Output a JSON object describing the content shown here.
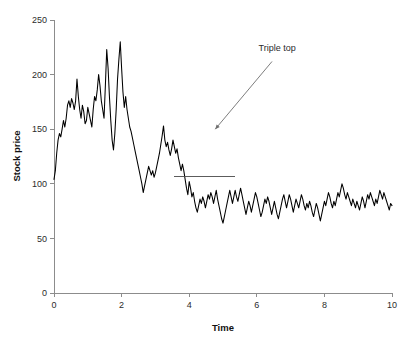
{
  "chart_data": {
    "type": "line",
    "title": "",
    "xlabel": "Time",
    "ylabel": "Stock price",
    "xlim": [
      0,
      10
    ],
    "ylim": [
      0,
      250
    ],
    "xticks": [
      0,
      2,
      4,
      6,
      8,
      10
    ],
    "xtick_labels": [
      "0",
      "2",
      "4",
      "6",
      "8",
      "10"
    ],
    "yticks": [
      0,
      50,
      100,
      150,
      200,
      250
    ],
    "ytick_labels": [
      "0",
      "50",
      "100",
      "150",
      "200",
      "250"
    ],
    "grid": false,
    "legend": false,
    "line_color": "#000000",
    "series": [
      {
        "name": "Stock price",
        "x": [
          0.0,
          0.04,
          0.08,
          0.12,
          0.16,
          0.2,
          0.24,
          0.28,
          0.32,
          0.36,
          0.4,
          0.44,
          0.48,
          0.52,
          0.56,
          0.6,
          0.64,
          0.68,
          0.72,
          0.76,
          0.8,
          0.84,
          0.88,
          0.92,
          0.96,
          1.0,
          1.04,
          1.08,
          1.12,
          1.16,
          1.2,
          1.24,
          1.28,
          1.32,
          1.36,
          1.4,
          1.44,
          1.48,
          1.52,
          1.56,
          1.6,
          1.64,
          1.68,
          1.72,
          1.76,
          1.8,
          1.84,
          1.88,
          1.92,
          1.96,
          2.0,
          2.04,
          2.08,
          2.12,
          2.16,
          2.2,
          2.24,
          2.28,
          2.32,
          2.36,
          2.4,
          2.44,
          2.48,
          2.52,
          2.56,
          2.6,
          2.64,
          2.68,
          2.72,
          2.76,
          2.8,
          2.84,
          2.88,
          2.92,
          2.96,
          3.0,
          3.04,
          3.08,
          3.12,
          3.16,
          3.2,
          3.24,
          3.28,
          3.32,
          3.36,
          3.4,
          3.44,
          3.48,
          3.52,
          3.56,
          3.6,
          3.64,
          3.68,
          3.72,
          3.76,
          3.8,
          3.84,
          3.88,
          3.92,
          3.96,
          4.0,
          4.04,
          4.08,
          4.12,
          4.16,
          4.2,
          4.24,
          4.28,
          4.32,
          4.36,
          4.4,
          4.44,
          4.48,
          4.52,
          4.56,
          4.6,
          4.64,
          4.68,
          4.72,
          4.76,
          4.8,
          4.84,
          4.88,
          4.92,
          4.96,
          5.0,
          5.04,
          5.08,
          5.12,
          5.16,
          5.2,
          5.24,
          5.28,
          5.32,
          5.36,
          5.4,
          5.44,
          5.48,
          5.52,
          5.56,
          5.6,
          5.64,
          5.68,
          5.72,
          5.76,
          5.8,
          5.84,
          5.88,
          5.92,
          5.96,
          6.0,
          6.04,
          6.08,
          6.12,
          6.16,
          6.2,
          6.24,
          6.28,
          6.32,
          6.36,
          6.4,
          6.44,
          6.48,
          6.52,
          6.56,
          6.6,
          6.64,
          6.68,
          6.72,
          6.76,
          6.8,
          6.84,
          6.88,
          6.92,
          6.96,
          7.0,
          7.04,
          7.08,
          7.12,
          7.16,
          7.2,
          7.24,
          7.28,
          7.32,
          7.36,
          7.4,
          7.44,
          7.48,
          7.52,
          7.56,
          7.6,
          7.64,
          7.68,
          7.72,
          7.76,
          7.8,
          7.84,
          7.88,
          7.92,
          7.96,
          8.0,
          8.04,
          8.08,
          8.12,
          8.16,
          8.2,
          8.24,
          8.28,
          8.32,
          8.36,
          8.4,
          8.44,
          8.48,
          8.52,
          8.56,
          8.6,
          8.64,
          8.68,
          8.72,
          8.76,
          8.8,
          8.84,
          8.88,
          8.92,
          8.96,
          9.0,
          9.04,
          9.08,
          9.12,
          9.16,
          9.2,
          9.24,
          9.28,
          9.32,
          9.36,
          9.4,
          9.44,
          9.48,
          9.52,
          9.56,
          9.6,
          9.64,
          9.68,
          9.72,
          9.76,
          9.8,
          9.84,
          9.88,
          9.92,
          9.96,
          10.0
        ],
        "y": [
          104,
          112,
          128,
          140,
          146,
          143,
          150,
          158,
          152,
          160,
          172,
          176,
          170,
          178,
          174,
          168,
          176,
          196,
          180,
          168,
          160,
          172,
          166,
          155,
          158,
          170,
          164,
          158,
          152,
          168,
          180,
          176,
          186,
          200,
          190,
          176,
          168,
          160,
          190,
          223,
          206,
          180,
          158,
          140,
          131,
          146,
          168,
          196,
          214,
          230,
          206,
          184,
          170,
          180,
          168,
          160,
          152,
          148,
          142,
          136,
          130,
          124,
          118,
          112,
          106,
          100,
          92,
          98,
          104,
          110,
          116,
          112,
          108,
          112,
          106,
          110,
          116,
          122,
          128,
          136,
          144,
          153,
          140,
          134,
          138,
          131,
          126,
          132,
          140,
          134,
          128,
          132,
          124,
          118,
          112,
          118,
          112,
          104,
          96,
          90,
          102,
          96,
          88,
          92,
          84,
          78,
          74,
          80,
          86,
          82,
          88,
          84,
          78,
          84,
          90,
          86,
          92,
          88,
          82,
          88,
          94,
          86,
          80,
          74,
          68,
          64,
          70,
          76,
          82,
          88,
          94,
          88,
          82,
          88,
          94,
          88,
          84,
          90,
          96,
          90,
          84,
          78,
          72,
          78,
          84,
          80,
          74,
          80,
          86,
          92,
          88,
          82,
          76,
          70,
          74,
          80,
          86,
          82,
          88,
          84,
          78,
          72,
          78,
          84,
          78,
          72,
          68,
          74,
          80,
          86,
          90,
          84,
          78,
          84,
          90,
          86,
          80,
          74,
          80,
          86,
          82,
          78,
          84,
          90,
          86,
          80,
          76,
          82,
          78,
          84,
          80,
          74,
          70,
          76,
          82,
          78,
          72,
          66,
          72,
          78,
          84,
          80,
          86,
          92,
          88,
          82,
          78,
          84,
          80,
          86,
          92,
          88,
          94,
          100,
          96,
          90,
          86,
          92,
          88,
          84,
          80,
          86,
          82,
          78,
          84,
          80,
          76,
          82,
          88,
          84,
          78,
          84,
          90,
          86,
          92,
          88,
          84,
          80,
          86,
          82,
          88,
          94,
          90,
          86,
          92,
          88,
          84,
          80,
          76,
          82,
          80
        ]
      }
    ],
    "annotations": [
      {
        "text": "Triple top",
        "x_data": 6.6,
        "y_data": 222,
        "arrow_from_x_data": 6.45,
        "arrow_from_y_data": 212,
        "arrow_to_x_data": 4.77,
        "arrow_to_y_data": 150,
        "color": "#6e6e6e"
      }
    ],
    "reference_lines": [
      {
        "name": "support-level",
        "orientation": "horizontal",
        "y_value": 107,
        "x_start": 3.55,
        "x_end": 5.35,
        "color": "#4a4a4a"
      }
    ],
    "pattern_peaks": [
      {
        "label": "peak-1",
        "x": 3.93,
        "y": 145
      },
      {
        "label": "peak-2",
        "x": 4.42,
        "y": 141
      },
      {
        "label": "peak-3",
        "x": 4.78,
        "y": 148
      }
    ]
  },
  "figure": {
    "background_color": "#ffffff",
    "axis_color": "#8c8c8c",
    "text_color": "#2b2b2b"
  }
}
